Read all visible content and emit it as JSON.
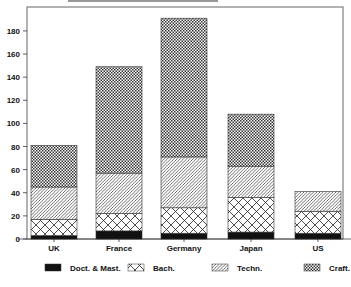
{
  "chart_data": {
    "type": "bar",
    "stacked": true,
    "title": "",
    "xlabel": "",
    "ylabel": "",
    "ylim": [
      0,
      190
    ],
    "yticks": [
      0,
      20,
      40,
      60,
      80,
      100,
      120,
      140,
      160,
      180
    ],
    "grid": false,
    "legend_position": "bottom",
    "categories": [
      "UK",
      "France",
      "Germany",
      "Japan",
      "US"
    ],
    "series": [
      {
        "name": "Doct. & Mast.",
        "pattern": "solid-black",
        "values": [
          3,
          7,
          5,
          6,
          5
        ]
      },
      {
        "name": "Bach.",
        "pattern": "crosshatch-diamond",
        "values": [
          14,
          15,
          22,
          30,
          19
        ]
      },
      {
        "name": "Techn.",
        "pattern": "diagonal-lines",
        "values": [
          28,
          35,
          44,
          27,
          17
        ]
      },
      {
        "name": "Craft.",
        "pattern": "dense-checker",
        "values": [
          36,
          92,
          120,
          45,
          0
        ]
      }
    ],
    "totals": [
      81,
      149,
      191,
      108,
      41
    ]
  },
  "legend": {
    "items": [
      {
        "label": "Doct. & Mast.",
        "pattern": "solid-black"
      },
      {
        "label": "Bach.",
        "pattern": "crosshatch-diamond"
      },
      {
        "label": "Techn.",
        "pattern": "diagonal-lines"
      },
      {
        "label": "Craft.",
        "pattern": "dense-checker"
      }
    ]
  },
  "colors": {
    "ink": "#111111",
    "background": "#ffffff",
    "frame": "#555555"
  }
}
